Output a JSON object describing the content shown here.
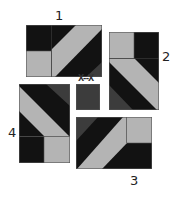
{
  "colors": {
    "black": "#121212",
    "dark_gray": "#3c3c3c",
    "light_gray": "#b4b4b4",
    "outline": "#555555",
    "background": "#ffffff"
  },
  "labels": {
    "block1": "1",
    "block2": "2",
    "block3": "3",
    "block4": "4",
    "center_mark": "X--X"
  },
  "blocks": [
    {
      "id": 1,
      "x": 26,
      "y": 25,
      "w": 76,
      "h": 52
    },
    {
      "id": 2,
      "x": 109,
      "y": 32,
      "w": 50,
      "h": 78
    },
    {
      "id": 3,
      "x": 76,
      "y": 117,
      "w": 76,
      "h": 52
    },
    {
      "id": 4,
      "x": 19,
      "y": 84,
      "w": 51,
      "h": 79
    },
    {
      "id": "center",
      "x": 76,
      "y": 84,
      "w": 24,
      "h": 26
    }
  ]
}
